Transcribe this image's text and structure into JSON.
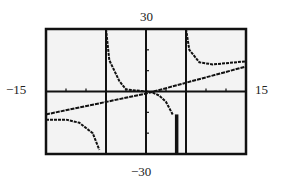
{
  "chart_data": {
    "type": "line",
    "title": "",
    "xlabel": "",
    "ylabel": "",
    "xlim": [
      -15,
      15
    ],
    "ylim": [
      -30,
      30
    ],
    "grid": false,
    "window_labels": {
      "ymax": "30",
      "ymin": "−30",
      "xmin": "−15",
      "xmax": "15"
    },
    "vertical_asymptotes": [
      -6,
      6
    ],
    "series": [
      {
        "name": "rational function",
        "description": "graph with vertical asymptotes near x=-6 and x=6 approaching slant asymptote",
        "points_left_branch": [
          [
            -15,
            -13.5
          ],
          [
            -12,
            -13.5
          ],
          [
            -10,
            -15
          ],
          [
            -8,
            -20
          ],
          [
            -7,
            -28
          ]
        ],
        "points_middle_branch": [
          [
            -6,
            30
          ],
          [
            -5.5,
            15
          ],
          [
            -4,
            5
          ],
          [
            -3,
            1
          ],
          [
            0,
            0
          ],
          [
            1,
            -0.5
          ],
          [
            2,
            -2
          ],
          [
            3,
            -5
          ],
          [
            4,
            -11
          ]
        ],
        "points_right_branch": [
          [
            6,
            30
          ],
          [
            6.5,
            20
          ],
          [
            8,
            14
          ],
          [
            10,
            13
          ],
          [
            15,
            14.5
          ]
        ]
      },
      {
        "name": "slant asymptote",
        "points": [
          [
            -15,
            -11
          ],
          [
            0,
            -1
          ],
          [
            15,
            12
          ]
        ]
      }
    ],
    "axis_ticks": {
      "x_step": 3,
      "y_step": 10
    }
  },
  "labels": {
    "top": "30",
    "bottom": "−30",
    "left": "−15",
    "right": "15"
  }
}
